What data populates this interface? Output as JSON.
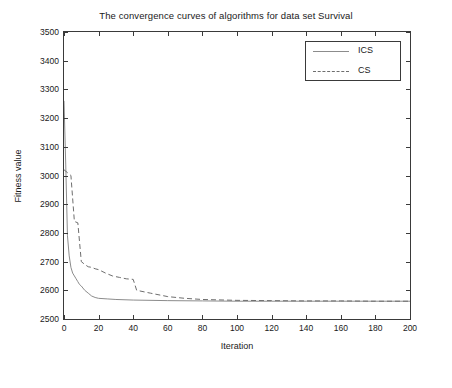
{
  "chart_data": {
    "type": "line",
    "title": "The convergence curves of algorithms for data set Survival",
    "xlabel": "Iteration",
    "ylabel": "Fitness value",
    "xlim": [
      0,
      200
    ],
    "ylim": [
      2500,
      3500
    ],
    "xticks": [
      0,
      20,
      40,
      60,
      80,
      100,
      120,
      140,
      160,
      180,
      200
    ],
    "yticks": [
      2500,
      2600,
      2700,
      2800,
      2900,
      3000,
      3100,
      3200,
      3300,
      3400,
      3500
    ],
    "grid": false,
    "legend_position": "top-right",
    "series": [
      {
        "name": "ICS",
        "style": "solid",
        "color": "#8c8c8c",
        "x": [
          0,
          1,
          2,
          3,
          4,
          5,
          6,
          7,
          8,
          9,
          10,
          12,
          14,
          16,
          18,
          20,
          25,
          30,
          40,
          60,
          80,
          100,
          120,
          140,
          160,
          180,
          200
        ],
        "y": [
          3260,
          3040,
          2790,
          2720,
          2680,
          2660,
          2650,
          2640,
          2630,
          2620,
          2615,
          2600,
          2590,
          2580,
          2575,
          2572,
          2570,
          2568,
          2566,
          2564,
          2563,
          2562,
          2562,
          2562,
          2562,
          2562,
          2562
        ]
      },
      {
        "name": "CS",
        "style": "dashed",
        "color": "#6e6e6e",
        "x": [
          0,
          2,
          4,
          6,
          8,
          10,
          12,
          14,
          16,
          18,
          20,
          24,
          28,
          32,
          36,
          40,
          42,
          50,
          60,
          70,
          80,
          100,
          120,
          140,
          160,
          180,
          200
        ],
        "y": [
          3020,
          3010,
          3000,
          2840,
          2835,
          2700,
          2690,
          2682,
          2680,
          2675,
          2672,
          2660,
          2650,
          2645,
          2640,
          2638,
          2600,
          2590,
          2578,
          2572,
          2568,
          2565,
          2564,
          2563,
          2563,
          2562,
          2562
        ]
      }
    ]
  },
  "legend": {
    "items": [
      {
        "label": "ICS"
      },
      {
        "label": "CS"
      }
    ]
  }
}
